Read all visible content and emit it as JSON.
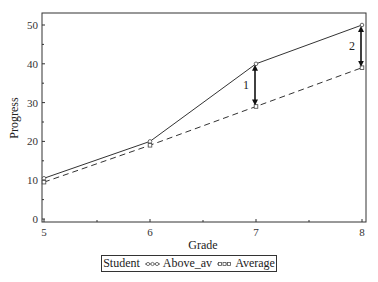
{
  "chart_data": {
    "type": "line",
    "title": "",
    "xlabel": "Grade",
    "ylabel": "Progress",
    "x": [
      5,
      6,
      7,
      8
    ],
    "xlim": [
      5,
      8
    ],
    "ylim": [
      0,
      52
    ],
    "xticks": [
      5,
      6,
      7,
      8
    ],
    "yticks": [
      0,
      10,
      20,
      30,
      40,
      50
    ],
    "grid": false,
    "legend_position": "bottom",
    "legend_title": "Student",
    "series": [
      {
        "name": "Above_av",
        "values": [
          10.5,
          20,
          40,
          50
        ],
        "style": "solid",
        "marker": "circle"
      },
      {
        "name": "Average",
        "values": [
          9.5,
          19,
          29,
          39
        ],
        "style": "dashed",
        "marker": "square"
      }
    ],
    "annotations": [
      {
        "label": "1",
        "x": 7,
        "from": 29,
        "to": 40,
        "type": "double-arrow"
      },
      {
        "label": "2",
        "x": 8,
        "from": 39,
        "to": 50,
        "type": "double-arrow"
      }
    ]
  },
  "legend": {
    "title": "Student",
    "items": [
      {
        "label": "Above_av"
      },
      {
        "label": "Average"
      }
    ]
  }
}
